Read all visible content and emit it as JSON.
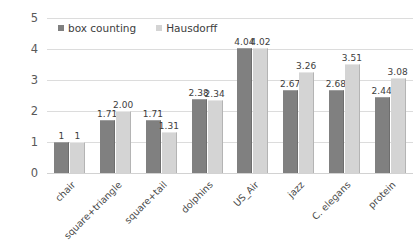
{
  "chart_data": {
    "type": "bar",
    "title": "",
    "xlabel": "",
    "ylabel": "",
    "ylim": [
      0,
      5
    ],
    "yticks": [
      0,
      1,
      2,
      3,
      4,
      5
    ],
    "grid": true,
    "legend_position": "top-left",
    "categories": [
      "chair",
      "square+triangle",
      "square+tail",
      "dolphins",
      "US_Air",
      "jazz",
      "C. elegans",
      "protein"
    ],
    "series": [
      {
        "name": "box counting",
        "color": "#808080",
        "values": [
          1,
          1.71,
          1.71,
          2.38,
          4.04,
          2.67,
          2.68,
          2.44
        ],
        "labels": [
          "1",
          "1.71",
          "1.71",
          "2.38",
          "4.04",
          "2.67",
          "2.68",
          "2.44"
        ]
      },
      {
        "name": "Hausdorff",
        "color": "#d4d4d4",
        "values": [
          1,
          2.0,
          1.31,
          2.34,
          4.02,
          3.26,
          3.51,
          3.08
        ],
        "labels": [
          "1",
          "2.00",
          "1.31",
          "2.34",
          "4.02",
          "3.26",
          "3.51",
          "3.08"
        ]
      }
    ]
  }
}
